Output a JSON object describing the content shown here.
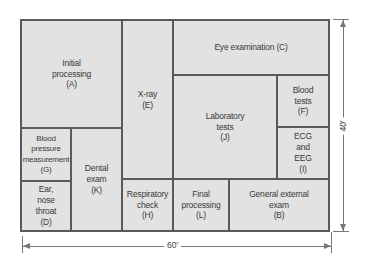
{
  "rooms": {
    "A": {
      "label": "Initial\nprocessing\n(A)"
    },
    "E": {
      "label": "X-ray\n(E)"
    },
    "C": {
      "label": "Eye examination (C)"
    },
    "J": {
      "label": "Laboratory\ntests\n(J)"
    },
    "F": {
      "label": "Blood\ntests\n(F)"
    },
    "I": {
      "label": "ECG\nand\nEEG\n(I)"
    },
    "G": {
      "label": "Blood\npressure\nmeasurement\n(G)"
    },
    "K": {
      "label": "Dental\nexam\n(K)"
    },
    "D": {
      "label": "Ear,\nnose\nthroat\n(D)"
    },
    "H": {
      "label": "Respiratory\ncheck\n(H)"
    },
    "L": {
      "label": "Final\nprocessing\n(L)"
    },
    "B": {
      "label": "General external\nexam\n(B)"
    }
  },
  "dimensions": {
    "width_label": "60′",
    "height_label": "40′"
  },
  "colors": {
    "room_fill": "#e2e2e2",
    "wall": "#5a5a5a"
  }
}
